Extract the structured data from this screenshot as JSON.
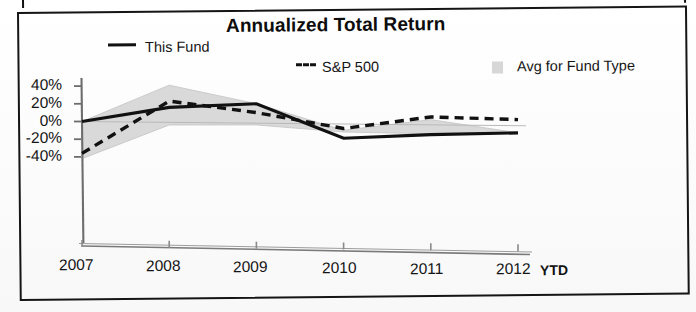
{
  "chart_data": {
    "type": "line",
    "title": "Annualized Total Return",
    "xlabel": "",
    "ylabel": "",
    "categories": [
      "2007",
      "2008",
      "2009",
      "2010",
      "2011",
      "2012"
    ],
    "x_axis_suffix_label": "YTD",
    "ytick_labels": [
      "40%",
      "20%",
      "0%",
      "-20%",
      "-40%"
    ],
    "ytick_values": [
      40,
      20,
      0,
      -20,
      -40
    ],
    "ylim": [
      -50,
      45
    ],
    "grid": false,
    "legend_position": "top",
    "series": [
      {
        "name": "This Fund",
        "style": "solid-line",
        "color": "#111111",
        "values": [
          0,
          17,
          22,
          -16,
          -11,
          -8
        ]
      },
      {
        "name": "S&P 500",
        "style": "dashed-line",
        "color": "#111111",
        "values": [
          -36,
          24,
          12,
          -5,
          9,
          7
        ]
      },
      {
        "name": "Avg for Fund Type",
        "style": "shaded-band",
        "color": "#d9d9d9",
        "upper_values": [
          0,
          42,
          22,
          -7,
          6,
          -8
        ],
        "lower_values": [
          -42,
          -3,
          -2,
          -9,
          -10,
          -8
        ]
      }
    ]
  },
  "legend": {
    "fund_label": "This Fund",
    "sp_label": "S&P 500",
    "avg_label": "Avg for Fund Type"
  }
}
